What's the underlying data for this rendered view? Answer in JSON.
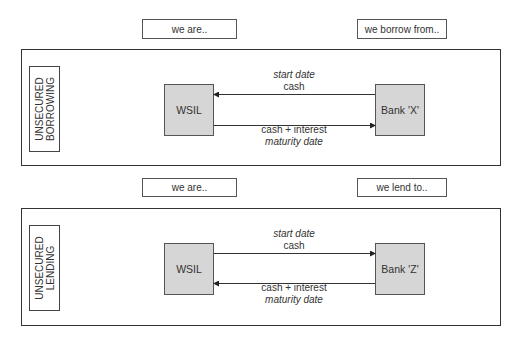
{
  "sections": [
    {
      "id": "borrowing",
      "side_label": "UNSECURED\nBORROWING",
      "header_left": "we are..",
      "header_right": "we borrow from..",
      "left_party": "WSIL",
      "right_party": "Bank 'X'",
      "top_flow": {
        "date_label": "start date",
        "item_label": "cash",
        "direction": "right-to-left"
      },
      "bottom_flow": {
        "item_label": "cash + interest",
        "date_label": "maturity date",
        "direction": "left-to-right"
      }
    },
    {
      "id": "lending",
      "side_label": "UNSECURED\nLENDING",
      "header_left": "we are..",
      "header_right": "we lend to..",
      "left_party": "WSIL",
      "right_party": "Bank 'Z'",
      "top_flow": {
        "date_label": "start date",
        "item_label": "cash",
        "direction": "left-to-right"
      },
      "bottom_flow": {
        "item_label": "cash + interest",
        "date_label": "maturity date",
        "direction": "right-to-left"
      }
    }
  ],
  "colors": {
    "party_fill": "#d6d6d6",
    "line": "#333333"
  }
}
